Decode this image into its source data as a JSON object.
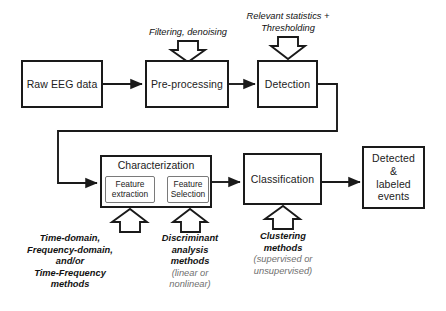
{
  "figure": {
    "type": "flowchart"
  },
  "nodes": {
    "raw": {
      "label": "Raw EEG data"
    },
    "preprocessing": {
      "label": "Pre-processing"
    },
    "detection": {
      "label": "Detection"
    },
    "characterization": {
      "label": "Characterization"
    },
    "feature_extraction": {
      "label": "Feature\nextraction"
    },
    "feature_selection": {
      "label": "Feature\nSelection"
    },
    "classification": {
      "label": "Classification"
    },
    "output": {
      "label": "Detected\n&\nlabeled\nevents"
    }
  },
  "annotations": {
    "preprocessing_note": {
      "text": "Filtering, denoising"
    },
    "detection_note": {
      "text": "Relevant statistics +\nThresholding"
    },
    "feature_extraction_note": {
      "main": "Time-domain,\nFrequency-domain,\nand/or\nTime-Frequency\nmethods",
      "sub": ""
    },
    "feature_selection_note": {
      "main": "Discriminant\nanalysis\nmethods",
      "sub": "(linear or\nnonlinear)"
    },
    "classification_note": {
      "main": "Clustering\nmethods",
      "sub": "(supervised or\nunsupervised)"
    }
  },
  "colors": {
    "stroke": "#1a1a1a",
    "subnode_stroke": "#7a7a7a",
    "text": "#222222",
    "muted_text": "#6f6f6f",
    "background": "#ffffff"
  }
}
